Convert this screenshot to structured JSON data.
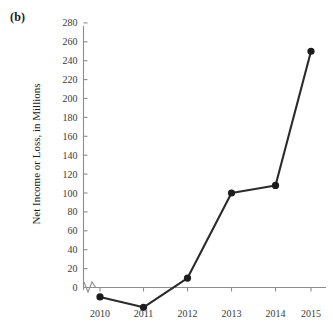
{
  "figure": {
    "panel_label": "(b)",
    "caption_ghost": "",
    "background_color": "#ffffff",
    "series_color": "#1c1c1c",
    "axis_color": "#8d8d92",
    "text_color": "#1a1a1a"
  },
  "chart_data": {
    "type": "line",
    "title": "",
    "subtitle": "",
    "xlabel": "",
    "ylabel": "Net Income or Loss, in Millions",
    "categories": [
      "2010",
      "2011",
      "2012",
      "2013",
      "2014",
      "2015"
    ],
    "x": [
      2010,
      2011,
      2012,
      2013,
      2014,
      2015
    ],
    "values": [
      -10,
      -21,
      10,
      100,
      108,
      250
    ],
    "series": [
      {
        "name": "Net Income or Loss",
        "values": [
          -10,
          -21,
          10,
          100,
          108,
          250
        ]
      }
    ],
    "ylim": [
      -30,
      290
    ],
    "yticks": [
      0,
      20,
      40,
      60,
      80,
      100,
      120,
      140,
      160,
      180,
      200,
      220,
      240,
      260,
      280
    ],
    "ytick_labels": [
      "0",
      "20",
      "40",
      "60",
      "80",
      "100",
      "120",
      "140",
      "160",
      "180",
      "200",
      "220",
      "240",
      "260",
      "280"
    ],
    "xticks": [
      "2010",
      "2011",
      "2012",
      "2013",
      "2014",
      "2015"
    ],
    "grid": false,
    "legend": null,
    "axis_break": true,
    "marker": "circle",
    "annotations": []
  }
}
